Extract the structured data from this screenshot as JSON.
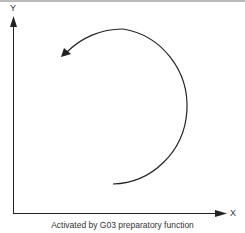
{
  "diagram": {
    "axes": {
      "y_label": "Y",
      "x_label": "X"
    },
    "arc": {
      "direction": "counterclockwise",
      "icon": "arc-arrow-icon"
    },
    "caption": "Activated by G03 preparatory function"
  }
}
